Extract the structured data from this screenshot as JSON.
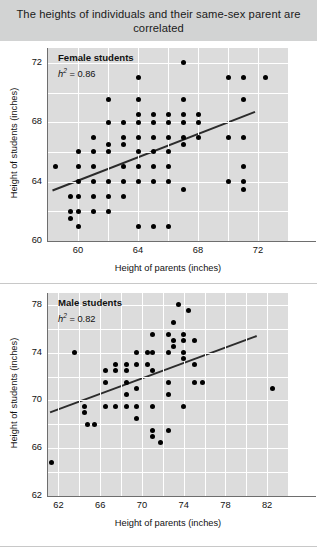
{
  "figure": {
    "title": "The heights of individuals and their same-sex parent are correlated",
    "title_bg": "#d2d3d3",
    "plot_bg": "#dcdcdc",
    "grid_color": "#ffffff",
    "point_color": "#000000",
    "line_color": "#2b2b2b"
  },
  "chart_data": [
    {
      "type": "scatter",
      "title": "Female students",
      "annotation": "h² = 0.86",
      "annotation_symbol": "h",
      "annotation_exponent": "2",
      "annotation_value": "= 0.86",
      "heritability": 0.86,
      "xlabel": "Height of parents (inches)",
      "ylabel": "Height of students (inches)",
      "xlim": [
        58,
        74
      ],
      "ylim": [
        60,
        73
      ],
      "xticks": [
        60,
        64,
        68,
        72
      ],
      "yticks": [
        60,
        64,
        68,
        72
      ],
      "grid": true,
      "legend": "none",
      "points": [
        [
          58.5,
          65.0
        ],
        [
          59.5,
          63.0
        ],
        [
          59.5,
          62.0
        ],
        [
          59.5,
          61.5
        ],
        [
          60.0,
          66.0
        ],
        [
          60.0,
          65.0
        ],
        [
          60.0,
          64.0
        ],
        [
          60.0,
          63.0
        ],
        [
          60.0,
          62.0
        ],
        [
          60.0,
          61.0
        ],
        [
          61.0,
          67.0
        ],
        [
          61.0,
          66.0
        ],
        [
          61.0,
          65.0
        ],
        [
          61.0,
          64.0
        ],
        [
          61.0,
          63.0
        ],
        [
          61.0,
          62.0
        ],
        [
          62.0,
          69.5
        ],
        [
          62.0,
          68.0
        ],
        [
          62.0,
          66.5
        ],
        [
          62.0,
          66.0
        ],
        [
          62.0,
          64.0
        ],
        [
          62.0,
          63.0
        ],
        [
          62.0,
          62.0
        ],
        [
          63.0,
          68.0
        ],
        [
          63.0,
          67.0
        ],
        [
          63.0,
          66.5
        ],
        [
          63.0,
          65.0
        ],
        [
          63.0,
          64.0
        ],
        [
          63.0,
          63.0
        ],
        [
          64.0,
          71.0
        ],
        [
          64.0,
          69.5
        ],
        [
          64.0,
          68.5
        ],
        [
          64.0,
          68.0
        ],
        [
          64.0,
          67.0
        ],
        [
          64.0,
          66.0
        ],
        [
          64.0,
          65.0
        ],
        [
          64.0,
          64.0
        ],
        [
          64.0,
          61.0
        ],
        [
          65.0,
          68.5
        ],
        [
          65.0,
          68.0
        ],
        [
          65.0,
          67.0
        ],
        [
          65.0,
          66.0
        ],
        [
          65.0,
          65.0
        ],
        [
          65.0,
          64.0
        ],
        [
          65.0,
          61.0
        ],
        [
          66.0,
          68.5
        ],
        [
          66.0,
          68.0
        ],
        [
          66.0,
          67.0
        ],
        [
          66.0,
          66.0
        ],
        [
          66.0,
          65.0
        ],
        [
          66.0,
          64.0
        ],
        [
          66.0,
          61.0
        ],
        [
          67.0,
          72.0
        ],
        [
          67.0,
          69.5
        ],
        [
          67.0,
          68.5
        ],
        [
          67.0,
          68.0
        ],
        [
          67.0,
          67.0
        ],
        [
          67.0,
          66.5
        ],
        [
          67.0,
          63.5
        ],
        [
          68.0,
          68.5
        ],
        [
          68.0,
          68.0
        ],
        [
          68.0,
          67.0
        ],
        [
          70.0,
          71.0
        ],
        [
          70.0,
          67.0
        ],
        [
          70.0,
          64.0
        ],
        [
          71.0,
          71.0
        ],
        [
          71.0,
          69.5
        ],
        [
          71.0,
          67.0
        ],
        [
          71.0,
          65.0
        ],
        [
          71.0,
          63.5
        ],
        [
          71.0,
          64.0
        ],
        [
          72.5,
          71.0
        ]
      ],
      "fit_line": {
        "x0": 58.3,
        "y0": 63.4,
        "x1": 71.8,
        "y1": 68.7
      }
    },
    {
      "type": "scatter",
      "title": "Male students",
      "annotation": "h² = 0.82",
      "annotation_symbol": "h",
      "annotation_exponent": "2",
      "annotation_value": "= 0.82",
      "heritability": 0.82,
      "xlabel": "Height of parents (inches)",
      "ylabel": "Height of students (inches)",
      "xlim": [
        61,
        84
      ],
      "ylim": [
        62,
        79
      ],
      "xticks": [
        62,
        66,
        70,
        74,
        78,
        82
      ],
      "yticks": [
        62,
        66,
        70,
        74,
        78
      ],
      "grid": true,
      "legend": "none",
      "points": [
        [
          61.3,
          64.8
        ],
        [
          63.5,
          74.0
        ],
        [
          64.5,
          69.5
        ],
        [
          64.5,
          69.0
        ],
        [
          64.8,
          68.0
        ],
        [
          65.5,
          68.0
        ],
        [
          66.5,
          72.5
        ],
        [
          66.5,
          71.5
        ],
        [
          66.5,
          69.5
        ],
        [
          67.5,
          73.0
        ],
        [
          67.5,
          72.5
        ],
        [
          67.5,
          69.5
        ],
        [
          68.5,
          73.0
        ],
        [
          68.5,
          72.5
        ],
        [
          68.5,
          71.5
        ],
        [
          68.5,
          70.5
        ],
        [
          68.5,
          69.5
        ],
        [
          69.5,
          74.0
        ],
        [
          69.5,
          73.0
        ],
        [
          69.5,
          71.0
        ],
        [
          69.5,
          69.5
        ],
        [
          69.5,
          68.5
        ],
        [
          70.5,
          74.0
        ],
        [
          70.5,
          73.0
        ],
        [
          71.0,
          75.5
        ],
        [
          71.0,
          74.0
        ],
        [
          71.0,
          72.5
        ],
        [
          71.0,
          69.5
        ],
        [
          71.0,
          67.5
        ],
        [
          71.0,
          67.0
        ],
        [
          71.8,
          66.5
        ],
        [
          72.5,
          75.5
        ],
        [
          72.5,
          74.0
        ],
        [
          72.5,
          71.5
        ],
        [
          72.5,
          70.5
        ],
        [
          72.5,
          67.5
        ],
        [
          73.0,
          76.5
        ],
        [
          73.0,
          75.0
        ],
        [
          73.0,
          74.5
        ],
        [
          73.5,
          78.0
        ],
        [
          74.0,
          75.5
        ],
        [
          74.0,
          75.0
        ],
        [
          74.0,
          74.0
        ],
        [
          74.0,
          73.5
        ],
        [
          74.0,
          69.5
        ],
        [
          74.5,
          77.5
        ],
        [
          75.0,
          75.0
        ],
        [
          75.0,
          73.0
        ],
        [
          75.0,
          71.5
        ],
        [
          75.8,
          71.5
        ],
        [
          82.5,
          71.0
        ]
      ],
      "fit_line": {
        "x0": 61.2,
        "y0": 69.0,
        "x1": 81.0,
        "y1": 75.4
      }
    }
  ]
}
